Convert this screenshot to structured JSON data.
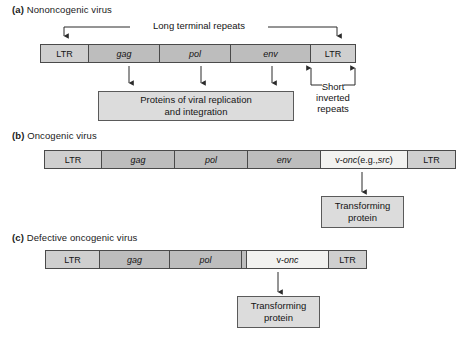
{
  "figure": {
    "colors": {
      "segment_gene": "#bdbdbd",
      "segment_ltr": "#cfcfcf",
      "segment_vonc": "#f2f2f0",
      "product_box": "#dcdcdc",
      "outline": "#4a4a4a",
      "background": "#ffffff",
      "text": "#141414"
    }
  },
  "panels": [
    {
      "label": "(a)",
      "title": "Nononcogenic virus",
      "top_annotation": "Long terminal repeats",
      "segments": [
        {
          "name": "LTR",
          "kind": "ltr"
        },
        {
          "name": "gag",
          "kind": "gene"
        },
        {
          "name": "pol",
          "kind": "gene"
        },
        {
          "name": "env",
          "kind": "gene"
        },
        {
          "name": "LTR",
          "kind": "ltr"
        }
      ],
      "product": "Proteins of viral replication and integration",
      "product_line1": "Proteins of viral replication",
      "product_line2": "and integration",
      "side_annotation_line1": "Short",
      "side_annotation_line2": "inverted",
      "side_annotation_line3": "repeats"
    },
    {
      "label": "(b)",
      "title": "Oncogenic virus",
      "segments": [
        {
          "name": "LTR",
          "kind": "ltr"
        },
        {
          "name": "gag",
          "kind": "gene"
        },
        {
          "name": "pol",
          "kind": "gene"
        },
        {
          "name": "env",
          "kind": "gene"
        },
        {
          "name": "v-onc (e.g., src)",
          "kind": "vonc"
        },
        {
          "name": "LTR",
          "kind": "ltr"
        }
      ],
      "vonc_prefix": "v-",
      "vonc_gene": "onc",
      "vonc_middle": " (e.g., ",
      "vonc_example": "src",
      "vonc_suffix": ")",
      "product": "Transforming protein",
      "product_line1": "Transforming",
      "product_line2": "protein"
    },
    {
      "label": "(c)",
      "title": "Defective oncogenic virus",
      "segments": [
        {
          "name": "LTR",
          "kind": "ltr"
        },
        {
          "name": "gag",
          "kind": "gene"
        },
        {
          "name": "pol",
          "kind": "gene"
        },
        {
          "name": "",
          "kind": "sliver"
        },
        {
          "name": "v-onc",
          "kind": "vonc"
        },
        {
          "name": "LTR",
          "kind": "ltr"
        }
      ],
      "vonc_prefix": "v-",
      "vonc_gene": "onc",
      "product": "Transforming protein",
      "product_line1": "Transforming",
      "product_line2": "protein"
    }
  ]
}
